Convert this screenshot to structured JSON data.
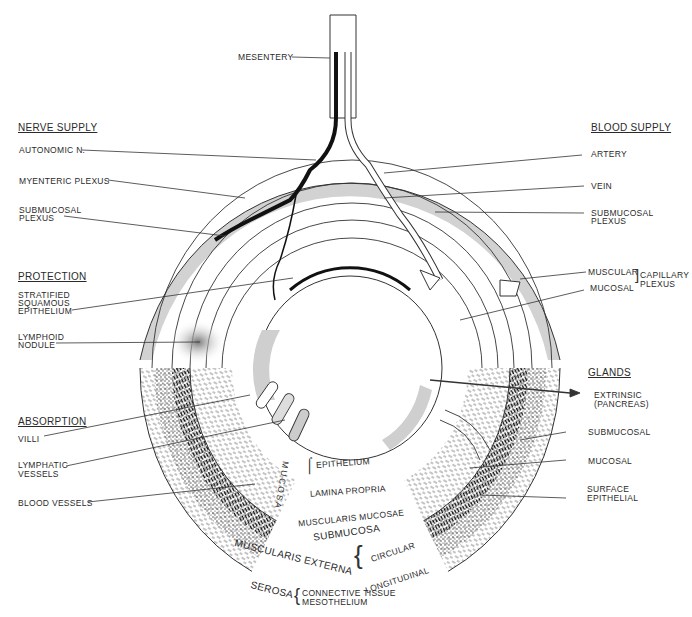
{
  "figure": {
    "top_label": "MESENTERY",
    "sections": {
      "nerve_supply": {
        "heading": "NERVE SUPPLY",
        "items": [
          "AUTONOMIC N.",
          "MYENTERIC PLEXUS",
          "SUBMUCOSAL",
          "PLEXUS"
        ]
      },
      "protection": {
        "heading": "PROTECTION",
        "items": [
          "STRATIFIED",
          "SQUAMOUS",
          "EPITHELIUM",
          "LYMPHOID",
          "NODULE"
        ]
      },
      "absorption": {
        "heading": "ABSORPTION",
        "items": [
          "VILLI",
          "LYMPHATIC",
          "VESSELS",
          "BLOOD VESSELS"
        ]
      },
      "blood_supply": {
        "heading": "BLOOD SUPPLY",
        "items": [
          "ARTERY",
          "VEIN",
          "SUBMUCOSAL",
          "PLEXUS"
        ],
        "capillary": {
          "muscular": "MUSCULAR",
          "mucosal": "MUCOSAL",
          "group1": "CAPILLARY",
          "group2": "PLEXUS"
        }
      },
      "glands": {
        "heading": "GLANDS",
        "items": [
          "EXTRINSIC",
          "(PANCREAS)",
          "SUBMUCOSAL",
          "MUCOSAL",
          "SURFACE",
          "EPITHELIAL"
        ]
      }
    },
    "layers": {
      "mucosa": "MUCOSA",
      "mucosa_parts": [
        "EPITHELIUM",
        "LAMINA PROPRIA",
        "MUSCULARIS MUCOSAE"
      ],
      "submucosa": "SUBMUCOSA",
      "muscularis_externa": "MUSCULARIS EXTERNA",
      "muscularis_parts": [
        "CIRCULAR",
        "LONGITUDINAL"
      ],
      "serosa": "SEROSA",
      "serosa_parts": [
        "CONNECTIVE TISSUE",
        "MESOTHELIUM"
      ]
    },
    "colors": {
      "line": "#2b2b2b",
      "shade": "#cfcfcf",
      "background": "#ffffff"
    }
  }
}
